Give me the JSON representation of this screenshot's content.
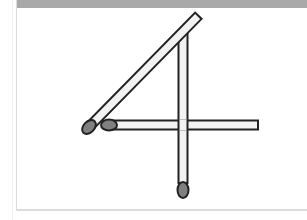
{
  "puzzle": {
    "title": "Matchstick puzzle",
    "shape": "digit 4",
    "matchstick_count": 3,
    "colors": {
      "header": "#a9a9a9",
      "card_border": "#dcdcdc",
      "stick_fill": "#f2f2f2",
      "stick_outline": "#222222",
      "match_head": "#808080"
    },
    "matches": [
      {
        "id": "diagonal",
        "orientation": "diagonal",
        "head": "bottom-left"
      },
      {
        "id": "vertical",
        "orientation": "vertical",
        "head": "bottom"
      },
      {
        "id": "horizontal",
        "orientation": "horizontal",
        "head": "left"
      }
    ]
  }
}
